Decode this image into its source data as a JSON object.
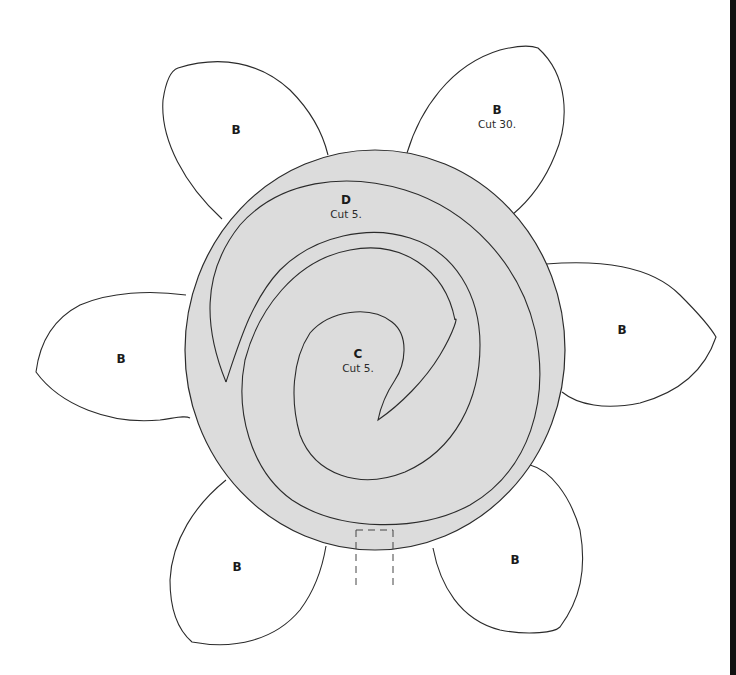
{
  "pattern": {
    "pieces": {
      "B": {
        "letter": "B",
        "cut": "Cut 30."
      },
      "C": {
        "letter": "C",
        "cut": "Cut 5."
      },
      "D": {
        "letter": "D",
        "cut": "Cut 5."
      }
    },
    "petals": [
      {
        "id": "top-left",
        "letter": "B"
      },
      {
        "id": "top-right",
        "letter": "B",
        "cut": "Cut 30."
      },
      {
        "id": "left",
        "letter": "B"
      },
      {
        "id": "right",
        "letter": "B"
      },
      {
        "id": "bottom-left",
        "letter": "B"
      },
      {
        "id": "bottom-right",
        "letter": "B"
      }
    ],
    "center": {
      "outer_letter": "D",
      "outer_cut": "Cut 5.",
      "inner_letter": "C",
      "inner_cut": "Cut 5."
    },
    "colors": {
      "circle_fill": "#dcdcdc",
      "outline": "#2b2b2b",
      "petal_fill": "#ffffff",
      "edge_bar": "#111111"
    }
  }
}
